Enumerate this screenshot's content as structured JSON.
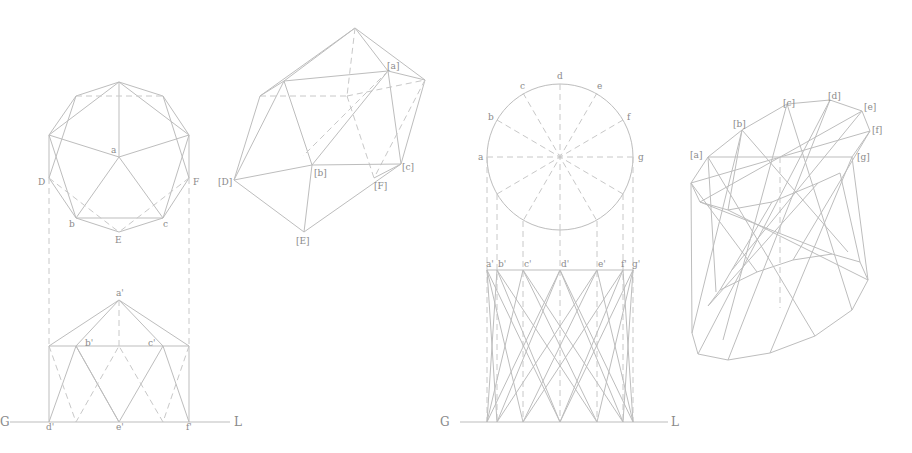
{
  "figure": {
    "colors": {
      "line": "#bdbdbd",
      "label": "#8a8a8a",
      "background": "#ffffff"
    }
  },
  "panel1": {
    "plan_labels": {
      "a": "a",
      "D": "D",
      "F": "F",
      "b": "b",
      "c": "c",
      "E": "E"
    },
    "elevation_labels": {
      "a": "a'",
      "b": "b'",
      "c": "c'",
      "d": "d'",
      "e": "e'",
      "f": "f'"
    },
    "ground_line": {
      "left": "G",
      "right": "L"
    }
  },
  "panel2": {
    "labels": {
      "a": "[a]",
      "b": "[b]",
      "c": "[c]",
      "D": "[D]",
      "E": "[E]",
      "F": "[F]"
    }
  },
  "panel3": {
    "plan_labels": {
      "a": "a",
      "b": "b",
      "c": "c",
      "d": "d",
      "e": "e",
      "f": "f",
      "g": "g"
    },
    "elevation_labels": {
      "a": "a'",
      "b": "b'",
      "c": "c'",
      "d": "d'",
      "e": "e'",
      "f": "f'",
      "g": "g'"
    },
    "ground_line": {
      "left": "G",
      "right": "L"
    }
  },
  "panel4": {
    "labels": {
      "a": "[a]",
      "b": "[b]",
      "c": "[c]",
      "d": "[d]",
      "e": "[e]",
      "f": "[f]",
      "g": "[g]"
    }
  }
}
